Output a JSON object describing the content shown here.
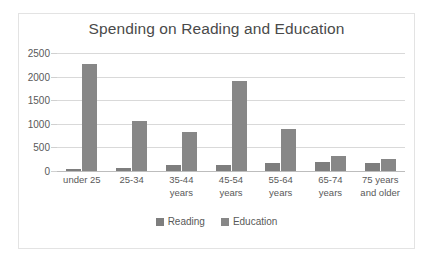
{
  "chart_data": {
    "type": "bar",
    "title": "Spending on Reading and Education",
    "xlabel": "",
    "ylabel": "",
    "ylim": [
      0,
      2500
    ],
    "yticks": [
      0,
      500,
      1000,
      1500,
      2000,
      2500
    ],
    "ytick_labels": [
      "0",
      "500",
      "1000",
      "1500",
      "2000",
      "2500"
    ],
    "grid": true,
    "legend_position": "bottom",
    "categories": [
      "under 25",
      "25-34",
      "35-44 years",
      "45-54 years",
      "55-64 years",
      "65-74 years",
      "75 years and older"
    ],
    "category_lines": [
      [
        "under 25"
      ],
      [
        "25-34"
      ],
      [
        "35-44",
        "years"
      ],
      [
        "45-54",
        "years"
      ],
      [
        "55-64",
        "years"
      ],
      [
        "65-74",
        "years"
      ],
      [
        "75 years",
        "and older"
      ]
    ],
    "series": [
      {
        "name": "Reading",
        "color": "#7e7e7e",
        "values": [
          50,
          70,
          130,
          120,
          170,
          200,
          180
        ]
      },
      {
        "name": "Education",
        "color": "#878787",
        "values": [
          2260,
          1060,
          830,
          1910,
          890,
          310,
          260
        ]
      }
    ]
  },
  "legend": {
    "items": [
      {
        "label": "Reading"
      },
      {
        "label": "Education"
      }
    ]
  }
}
